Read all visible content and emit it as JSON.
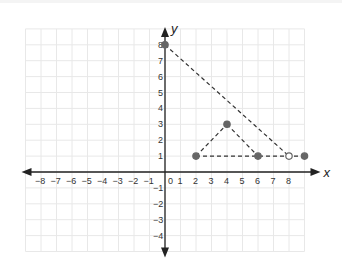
{
  "chart_data": {
    "type": "scatter",
    "title": "",
    "xlabel": "x",
    "ylabel": "y",
    "xlim": [
      -9,
      9
    ],
    "ylim": [
      -5,
      9
    ],
    "grid": true,
    "x_ticks": [
      "−8",
      "−7",
      "−6",
      "−5",
      "−4",
      "−3",
      "−2",
      "−1",
      "0",
      "1",
      "2",
      "3",
      "4",
      "5",
      "6",
      "7",
      "8"
    ],
    "y_ticks": [
      "8",
      "7",
      "6",
      "5",
      "4",
      "3",
      "2",
      "1",
      "−1",
      "−2",
      "−3",
      "−4"
    ],
    "points": [
      {
        "x": 0,
        "y": 8,
        "filled": true
      },
      {
        "x": 2,
        "y": 1,
        "filled": true
      },
      {
        "x": 4,
        "y": 3,
        "filled": true
      },
      {
        "x": 6,
        "y": 1,
        "filled": true
      },
      {
        "x": 8,
        "y": 1,
        "filled": false
      },
      {
        "x": 9,
        "y": 1,
        "filled": true
      }
    ],
    "segments": [
      {
        "from": [
          0,
          8
        ],
        "to": [
          8,
          1
        ],
        "style": "dashed"
      },
      {
        "from": [
          2,
          1
        ],
        "to": [
          4,
          3
        ],
        "style": "dashed"
      },
      {
        "from": [
          4,
          3
        ],
        "to": [
          6,
          1
        ],
        "style": "dashed"
      },
      {
        "from": [
          2,
          1
        ],
        "to": [
          9,
          1
        ],
        "style": "dashed"
      }
    ],
    "colors": {
      "point": "#666666",
      "line": "#333333",
      "axis": "#222222",
      "grid": "#e8e8e8"
    }
  }
}
